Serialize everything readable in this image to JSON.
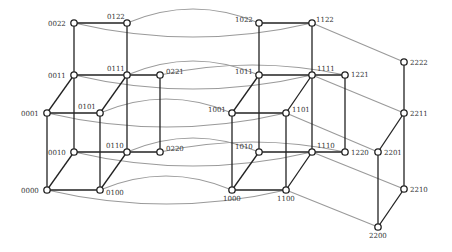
{
  "diagram": {
    "colors": {
      "edge": "#222222",
      "link": "#9a9a9a",
      "node_fill": "#ffffff",
      "node_stroke": "#222222",
      "label": "#333333"
    },
    "nodes": [
      {
        "id": "0022",
        "x": 74,
        "y": 23,
        "lx": -26,
        "ly": 3
      },
      {
        "id": "0122",
        "x": 127,
        "y": 23,
        "lx": -20,
        "ly": -4
      },
      {
        "id": "0011",
        "x": 74,
        "y": 75,
        "lx": -26,
        "ly": 3
      },
      {
        "id": "0111",
        "x": 127,
        "y": 75,
        "lx": -20,
        "ly": -4
      },
      {
        "id": "0221",
        "x": 160,
        "y": 75,
        "lx": 6,
        "ly": -1
      },
      {
        "id": "0001",
        "x": 47,
        "y": 113,
        "lx": -26,
        "ly": 3
      },
      {
        "id": "0101",
        "x": 100,
        "y": 113,
        "lx": -22,
        "ly": -4
      },
      {
        "id": "0010",
        "x": 74,
        "y": 152,
        "lx": -26,
        "ly": 3
      },
      {
        "id": "0110",
        "x": 127,
        "y": 152,
        "lx": -21,
        "ly": -4
      },
      {
        "id": "0220",
        "x": 160,
        "y": 152,
        "lx": 6,
        "ly": -1
      },
      {
        "id": "0000",
        "x": 47,
        "y": 190,
        "lx": -26,
        "ly": 3
      },
      {
        "id": "0100",
        "x": 100,
        "y": 190,
        "lx": 6,
        "ly": 5
      },
      {
        "id": "1022",
        "x": 259,
        "y": 23,
        "lx": -24,
        "ly": -1
      },
      {
        "id": "1122",
        "x": 312,
        "y": 23,
        "lx": 4,
        "ly": -1
      },
      {
        "id": "1011",
        "x": 259,
        "y": 75,
        "lx": -24,
        "ly": -1
      },
      {
        "id": "1111",
        "x": 312,
        "y": 75,
        "lx": 5,
        "ly": -4
      },
      {
        "id": "1221",
        "x": 345,
        "y": 75,
        "lx": 6,
        "ly": 2
      },
      {
        "id": "1001",
        "x": 232,
        "y": 113,
        "lx": -24,
        "ly": -1
      },
      {
        "id": "1101",
        "x": 286,
        "y": 113,
        "lx": 6,
        "ly": -1
      },
      {
        "id": "1010",
        "x": 259,
        "y": 152,
        "lx": -24,
        "ly": -3
      },
      {
        "id": "1110",
        "x": 312,
        "y": 152,
        "lx": 5,
        "ly": -4
      },
      {
        "id": "1220",
        "x": 345,
        "y": 152,
        "lx": 6,
        "ly": 3
      },
      {
        "id": "1000",
        "x": 232,
        "y": 190,
        "lx": -9,
        "ly": 11
      },
      {
        "id": "1100",
        "x": 286,
        "y": 190,
        "lx": -9,
        "ly": 11
      },
      {
        "id": "2222",
        "x": 404,
        "y": 62,
        "lx": 6,
        "ly": 3
      },
      {
        "id": "2211",
        "x": 404,
        "y": 113,
        "lx": 6,
        "ly": 3
      },
      {
        "id": "2201",
        "x": 378,
        "y": 152,
        "lx": 6,
        "ly": 3
      },
      {
        "id": "2210",
        "x": 404,
        "y": 189,
        "lx": 6,
        "ly": 3
      },
      {
        "id": "2200",
        "x": 378,
        "y": 227,
        "lx": -9,
        "ly": 11
      }
    ],
    "edges": [
      [
        "0022",
        "0122"
      ],
      [
        "0022",
        "0011"
      ],
      [
        "0122",
        "0111"
      ],
      [
        "0011",
        "0111"
      ],
      [
        "0111",
        "0221"
      ],
      [
        "0011",
        "0001"
      ],
      [
        "0111",
        "0101"
      ],
      [
        "0001",
        "0101"
      ],
      [
        "0011",
        "0010"
      ],
      [
        "0111",
        "0110"
      ],
      [
        "0221",
        "0220"
      ],
      [
        "0001",
        "0000"
      ],
      [
        "0101",
        "0100"
      ],
      [
        "0010",
        "0110"
      ],
      [
        "0110",
        "0220"
      ],
      [
        "0010",
        "0000"
      ],
      [
        "0110",
        "0100"
      ],
      [
        "0000",
        "0100"
      ],
      [
        "1022",
        "1122"
      ],
      [
        "1022",
        "1011"
      ],
      [
        "1122",
        "1111"
      ],
      [
        "1011",
        "1111"
      ],
      [
        "1111",
        "1221"
      ],
      [
        "1011",
        "1001"
      ],
      [
        "1111",
        "1101"
      ],
      [
        "1001",
        "1101"
      ],
      [
        "1011",
        "1010"
      ],
      [
        "1111",
        "1110"
      ],
      [
        "1221",
        "1220"
      ],
      [
        "1001",
        "1000"
      ],
      [
        "1101",
        "1100"
      ],
      [
        "1010",
        "1110"
      ],
      [
        "1110",
        "1220"
      ],
      [
        "1010",
        "1000"
      ],
      [
        "1110",
        "1100"
      ],
      [
        "1000",
        "1100"
      ],
      [
        "2222",
        "2211"
      ],
      [
        "2211",
        "2201"
      ],
      [
        "2211",
        "2210"
      ],
      [
        "2201",
        "2200"
      ],
      [
        "2210",
        "2200"
      ]
    ],
    "curved_links": [
      {
        "from": "0022",
        "to": "1122",
        "bend": 14
      },
      {
        "from": "0122",
        "to": "1022",
        "bend": -14
      },
      {
        "from": "0011",
        "to": "1111",
        "bend": 14
      },
      {
        "from": "0111",
        "to": "1011",
        "bend": -14
      },
      {
        "from": "0221",
        "to": "1221",
        "bend": -10
      },
      {
        "from": "0001",
        "to": "1101",
        "bend": 14
      },
      {
        "from": "0101",
        "to": "1001",
        "bend": -14
      },
      {
        "from": "0010",
        "to": "1110",
        "bend": 14
      },
      {
        "from": "0110",
        "to": "1010",
        "bend": -14
      },
      {
        "from": "0220",
        "to": "1220",
        "bend": -10
      },
      {
        "from": "0000",
        "to": "1100",
        "bend": 14
      },
      {
        "from": "0100",
        "to": "1000",
        "bend": -14
      }
    ],
    "straight_links": [
      [
        "1122",
        "2222"
      ],
      [
        "1111",
        "2211"
      ],
      [
        "1101",
        "2201"
      ],
      [
        "1110",
        "2210"
      ],
      [
        "1100",
        "2200"
      ]
    ]
  }
}
